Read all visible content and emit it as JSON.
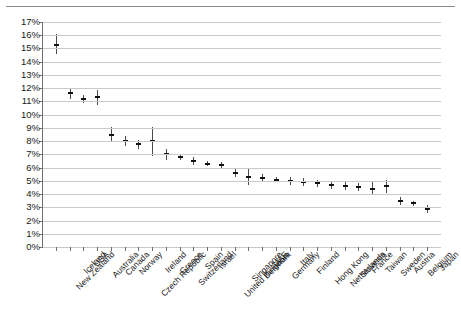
{
  "chart_data": {
    "type": "scatter",
    "title": "",
    "subtitle": "",
    "xlabel": "",
    "ylabel": "",
    "ylim": [
      0,
      17
    ],
    "ytick_step": 1,
    "ytick_labels": [
      "0%",
      "1%",
      "2%",
      "3%",
      "4%",
      "5%",
      "6%",
      "7%",
      "8%",
      "9%",
      "10%",
      "11%",
      "12%",
      "13%",
      "14%",
      "15%",
      "16%",
      "17%"
    ],
    "grid": true,
    "legend": "none",
    "error_bars": true,
    "value_unit": "%",
    "categories": [
      "New Zealand",
      "Iceland",
      "USA",
      "Australia",
      "Canada",
      "Norway",
      "Czech Republic",
      "Ireland",
      "Greece",
      "Switzerland",
      "Spain",
      "Israel",
      "United Kingdom",
      "Singapore",
      "Denmark",
      "UAE",
      "Germany",
      "Italy",
      "Finland",
      "Hong Kong",
      "Netherlands",
      "Slovenia",
      "France",
      "Taiwan",
      "Sweden",
      "Austria",
      "Belgium",
      "Japan"
    ],
    "series": [
      {
        "name": "Estimate",
        "values": [
          15.3,
          11.6,
          11.2,
          11.3,
          8.5,
          8.0,
          7.8,
          8.0,
          7.0,
          6.8,
          6.5,
          6.3,
          6.2,
          5.6,
          5.3,
          5.2,
          5.1,
          5.0,
          4.9,
          4.8,
          4.7,
          4.6,
          4.5,
          4.4,
          4.6,
          3.5,
          3.3,
          2.9
        ],
        "lower": [
          14.6,
          11.2,
          10.9,
          10.7,
          7.9,
          7.6,
          7.4,
          6.9,
          6.6,
          6.6,
          6.2,
          6.1,
          6.0,
          5.3,
          4.7,
          4.9,
          4.9,
          4.7,
          4.6,
          4.5,
          4.4,
          4.3,
          4.2,
          3.9,
          4.1,
          3.2,
          3.1,
          2.6
        ],
        "upper": [
          16.1,
          12.0,
          11.5,
          11.9,
          9.1,
          8.4,
          8.1,
          9.1,
          7.4,
          7.0,
          6.8,
          6.5,
          6.4,
          5.9,
          6.0,
          5.5,
          5.3,
          5.3,
          5.2,
          5.1,
          5.0,
          4.9,
          4.8,
          4.9,
          5.1,
          3.8,
          3.5,
          3.2
        ]
      }
    ]
  }
}
